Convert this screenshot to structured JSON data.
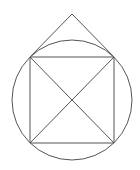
{
  "diagram": {
    "stroke_color": "#555555",
    "stroke_width": 1,
    "background": "#ffffff",
    "circle": {
      "cx": 72,
      "cy": 100,
      "r": 60
    },
    "square": {
      "top_left": [
        30,
        57
      ],
      "top_right": [
        114,
        57
      ],
      "bottom_right": [
        114,
        143
      ],
      "bottom_left": [
        30,
        143
      ]
    },
    "apex": [
      72,
      14
    ],
    "diagonals": [
      {
        "from": [
          30,
          57
        ],
        "to": [
          114,
          143
        ]
      },
      {
        "from": [
          114,
          57
        ],
        "to": [
          30,
          143
        ]
      }
    ],
    "center_point": [
      72,
      100
    ]
  }
}
